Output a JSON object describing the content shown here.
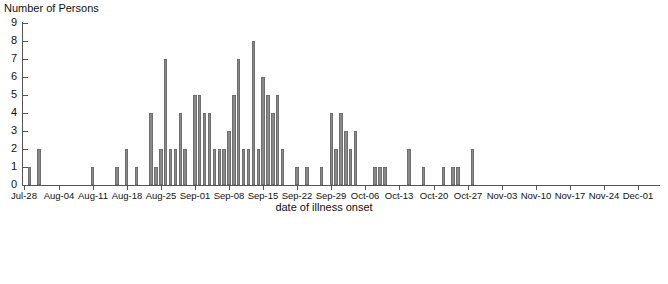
{
  "chart_data": {
    "type": "bar",
    "title": "",
    "subtitle": "",
    "ylabel": "Number of Persons",
    "xlabel": "date of illness onset",
    "ylim": [
      0,
      9
    ],
    "yticks": [
      0,
      1,
      2,
      3,
      4,
      5,
      6,
      7,
      8,
      9
    ],
    "grid": false,
    "legend": null,
    "bar_color": "#8a8a8a",
    "bar_edge_color": "#6e6e6e",
    "axis_color": "#555555",
    "background": "#ffffff",
    "xtick_labels": [
      "Jul-28",
      "Aug-04",
      "Aug-11",
      "Aug-18",
      "Aug-25",
      "Sep-01",
      "Sep-08",
      "Sep-15",
      "Sep-22",
      "Sep-29",
      "Oct-06",
      "Oct-13",
      "Oct-20",
      "Oct-27",
      "Nov-03",
      "Nov-10",
      "Nov-17",
      "Nov-24",
      "Dec-01"
    ],
    "xtick_interval_days": 7,
    "x_start": "Jul-28",
    "x_end": "Dec-05",
    "bin_width_days": 1,
    "categories": [
      "Jul-28",
      "Jul-29",
      "Jul-30",
      "Jul-31",
      "Aug-01",
      "Aug-02",
      "Aug-03",
      "Aug-04",
      "Aug-05",
      "Aug-06",
      "Aug-07",
      "Aug-08",
      "Aug-09",
      "Aug-10",
      "Aug-11",
      "Aug-12",
      "Aug-13",
      "Aug-14",
      "Aug-15",
      "Aug-16",
      "Aug-17",
      "Aug-18",
      "Aug-19",
      "Aug-20",
      "Aug-21",
      "Aug-22",
      "Aug-23",
      "Aug-24",
      "Aug-25",
      "Aug-26",
      "Aug-27",
      "Aug-28",
      "Aug-29",
      "Aug-30",
      "Aug-31",
      "Sep-01",
      "Sep-02",
      "Sep-03",
      "Sep-04",
      "Sep-05",
      "Sep-06",
      "Sep-07",
      "Sep-08",
      "Sep-09",
      "Sep-10",
      "Sep-11",
      "Sep-12",
      "Sep-13",
      "Sep-14",
      "Sep-15",
      "Sep-16",
      "Sep-17",
      "Sep-18",
      "Sep-19",
      "Sep-20",
      "Sep-21",
      "Sep-22",
      "Sep-23",
      "Sep-24",
      "Sep-25",
      "Sep-26",
      "Sep-27",
      "Sep-28",
      "Sep-29",
      "Sep-30",
      "Oct-01",
      "Oct-02",
      "Oct-03",
      "Oct-04",
      "Oct-05",
      "Oct-06",
      "Oct-07",
      "Oct-08",
      "Oct-09",
      "Oct-10",
      "Oct-11",
      "Oct-12",
      "Oct-13",
      "Oct-14",
      "Oct-15",
      "Oct-16",
      "Oct-17",
      "Oct-18",
      "Oct-19",
      "Oct-20",
      "Oct-21",
      "Oct-22",
      "Oct-23",
      "Oct-24",
      "Oct-25",
      "Oct-26",
      "Oct-27",
      "Oct-28",
      "Oct-29",
      "Oct-30",
      "Oct-31",
      "Nov-01",
      "Nov-02",
      "Nov-03",
      "Nov-04",
      "Nov-05",
      "Nov-06",
      "Nov-07",
      "Nov-08",
      "Nov-09",
      "Nov-10",
      "Nov-11",
      "Nov-12",
      "Nov-13",
      "Nov-14",
      "Nov-15",
      "Nov-16",
      "Nov-17",
      "Nov-18",
      "Nov-19",
      "Nov-20",
      "Nov-21",
      "Nov-22",
      "Nov-23",
      "Nov-24",
      "Nov-25",
      "Nov-26",
      "Nov-27",
      "Nov-28",
      "Nov-29",
      "Nov-30",
      "Dec-01",
      "Dec-02",
      "Dec-03",
      "Dec-04",
      "Dec-05"
    ],
    "values": [
      0,
      1,
      0,
      2,
      0,
      0,
      0,
      0,
      0,
      0,
      0,
      0,
      0,
      0,
      1,
      0,
      0,
      0,
      0,
      1,
      0,
      2,
      0,
      1,
      0,
      0,
      4,
      1,
      2,
      7,
      2,
      2,
      4,
      2,
      0,
      5,
      5,
      4,
      4,
      2,
      2,
      2,
      3,
      5,
      7,
      2,
      2,
      8,
      2,
      6,
      5,
      4,
      5,
      2,
      0,
      0,
      1,
      0,
      1,
      0,
      0,
      1,
      0,
      4,
      2,
      4,
      3,
      2,
      3,
      0,
      0,
      0,
      1,
      1,
      1,
      0,
      0,
      0,
      0,
      2,
      0,
      0,
      1,
      0,
      0,
      0,
      1,
      0,
      1,
      1,
      0,
      0,
      2,
      0,
      0,
      0,
      0,
      0,
      0,
      0,
      0,
      0,
      0,
      0,
      0,
      0,
      0,
      0,
      0,
      0,
      0,
      0,
      0,
      0,
      0,
      0,
      0,
      0,
      0,
      0,
      0,
      0,
      0,
      0,
      0,
      0,
      0,
      0,
      0,
      0,
      0
    ]
  },
  "bottom_chart": {
    "type": "bar",
    "ylim_visible_top": 9,
    "yticks": [
      9,
      8,
      7
    ],
    "values": [
      7,
      8,
      8
    ],
    "bar_color": "#8a8a8a",
    "note": "partially visible chart cropped at bottom edge"
  }
}
